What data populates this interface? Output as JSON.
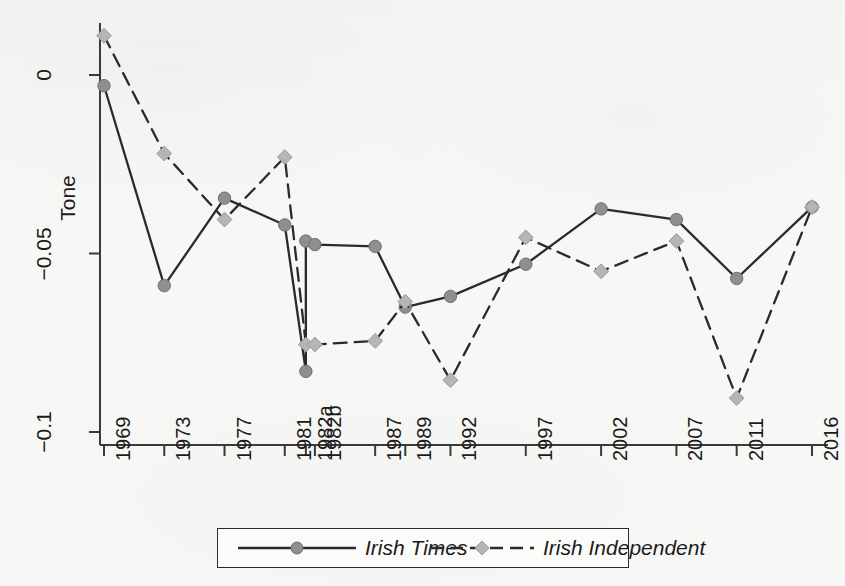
{
  "figure": {
    "background_color": "#f7f7f5",
    "axis_color": "#3a3a3a",
    "text_color": "#1b1b1b"
  },
  "axes": {
    "ylabel": "Tone",
    "yticks": [
      "0",
      "−0.05",
      "−0.1"
    ],
    "ytick_values": [
      0,
      -0.05,
      -0.1
    ],
    "xtick_labels": [
      "1969",
      "1973",
      "1977",
      "1981",
      "1982a",
      "1982b",
      "1987",
      "1989",
      "1992",
      "1997",
      "2002",
      "2007",
      "2011",
      "2016"
    ]
  },
  "legend": {
    "items": [
      {
        "label": "Irish Times",
        "style": "solid",
        "marker": "circle",
        "color": "#2a2a2a",
        "marker_color": "#8f8f8f"
      },
      {
        "label": "Irish Independent",
        "style": "dashed",
        "marker": "diamond",
        "color": "#2a2a2a",
        "marker_color": "#b5b5b5"
      }
    ]
  },
  "chart_data": {
    "type": "line",
    "title": "",
    "xlabel": "",
    "ylabel": "Tone",
    "categories": [
      "1969",
      "1973",
      "1977",
      "1981",
      "1982a",
      "1982b",
      "1987",
      "1989",
      "1992",
      "1997",
      "2002",
      "2007",
      "2011",
      "2016"
    ],
    "category_positions": [
      1969,
      1973,
      1977,
      1981,
      1982.4,
      1983.0,
      1987,
      1989,
      1992,
      1997,
      2002,
      2007,
      2011,
      2016
    ],
    "ylim": [
      -0.108,
      0.018
    ],
    "yticks": [
      0,
      -0.05,
      -0.1
    ],
    "grid": false,
    "legend_position": "bottom",
    "series": [
      {
        "name": "Irish Times",
        "style": "solid",
        "marker": "circle",
        "values": [
          -0.003,
          -0.059,
          -0.0345,
          -0.042,
          -0.0465,
          -0.0475,
          -0.048,
          -0.065,
          -0.062,
          -0.053,
          -0.0375,
          -0.0405,
          -0.057,
          -0.037
        ]
      },
      {
        "name": "Irish Independent",
        "style": "dashed",
        "marker": "diamond",
        "values": [
          0.011,
          -0.022,
          -0.0405,
          -0.023,
          -0.0755,
          -0.0755,
          -0.0745,
          -0.0635,
          -0.0855,
          -0.0455,
          -0.055,
          -0.0465,
          -0.0905,
          -0.037
        ]
      }
    ],
    "extra_points": [
      {
        "series": "Irish Times",
        "x": "1982a",
        "y": -0.083,
        "note": "low endpoint of steep drop"
      }
    ]
  }
}
